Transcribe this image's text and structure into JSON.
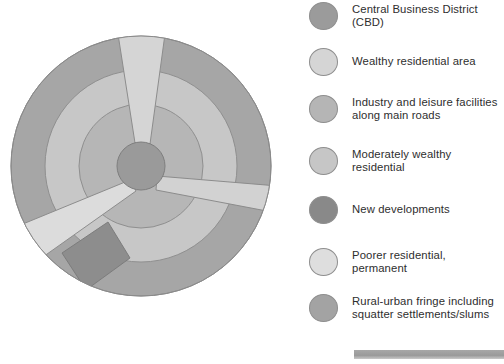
{
  "diagram": {
    "name": "urban-land-use-model",
    "center": {
      "x": 141,
      "y": 166
    },
    "radii": {
      "cbd": 24,
      "inner_ring": 62,
      "middle_ring": 96,
      "outer_ring": 130
    },
    "colors": {
      "cbd": "#9a9a9a",
      "wealthy_residential": "#d2d2d2",
      "industry_leisure": "#b4b4b4",
      "moderately_wealthy": "#c4c4c4",
      "new_developments": "#898989",
      "poorer_residential": "#dcdcdc",
      "rural_urban_fringe": "#a6a6a6",
      "outline": "#8c8c8c"
    },
    "zones": [
      {
        "id": "cbd",
        "label": "Central Business District (CBD)",
        "shape": "core-circle"
      },
      {
        "id": "ring-inner",
        "label": "Industry and leisure facilities along main roads",
        "shape": "inner-ring"
      },
      {
        "id": "ring-middle",
        "label": "Moderately wealthy residential",
        "shape": "middle-ring"
      },
      {
        "id": "ring-outer",
        "label": "Rural-urban fringe including squatter settlements/slums",
        "shape": "outer-ring"
      },
      {
        "id": "sector-top",
        "label": "Wealthy residential area",
        "shape": "sector",
        "bearing_deg": 0
      },
      {
        "id": "sector-east",
        "label": "Industry and leisure facilities along main roads",
        "shape": "sector",
        "bearing_deg": 115
      },
      {
        "id": "sector-southwest",
        "label": "Poorer residential, permanent",
        "shape": "sector",
        "bearing_deg": 250
      },
      {
        "id": "sector-south",
        "label": "New developments",
        "shape": "sector",
        "bearing_deg": 205
      }
    ]
  },
  "legend": {
    "name": "land-use-legend",
    "items": [
      {
        "color": "#9b9b9b",
        "label": "Central Business District (CBD)",
        "top": 2
      },
      {
        "color": "#d5d5d5",
        "label": "Wealthy residential area",
        "top": 48
      },
      {
        "color": "#b5b5b5",
        "label": "Industry and leisure facilities\nalong main roads",
        "top": 95
      },
      {
        "color": "#c6c6c6",
        "label": "Moderately wealthy residential",
        "top": 147
      },
      {
        "color": "#898989",
        "label": "New developments",
        "top": 196
      },
      {
        "color": "#dedede",
        "label": "Poorer residential, permanent",
        "top": 248
      },
      {
        "color": "#a3a3a3",
        "label": "Rural-urban fringe including\nsquatter settlements/slums",
        "top": 294
      }
    ]
  },
  "bottom_bar": {
    "name": "page-footer-rule",
    "color": "#a0a0a0"
  }
}
